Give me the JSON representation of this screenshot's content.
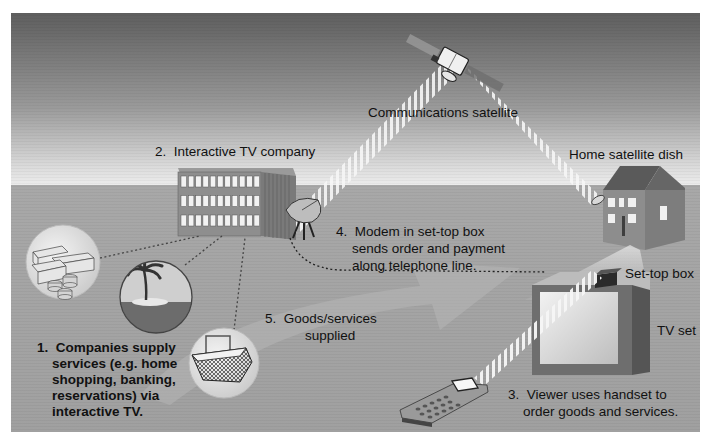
{
  "diagram": {
    "colors": {
      "sky_top": "#5e5e5e",
      "sky_horizon": "#e6e6e6",
      "ground": "#a3a3a3",
      "frame": "#ffffff",
      "beam": "#f4f4f4",
      "text": "#111111"
    },
    "labels": {
      "satellite": "Communications satellite",
      "company": "2.  Interactive TV company",
      "home_dish": "Home satellite dish",
      "set_top_box": "Set-top box",
      "tv_set": "TV set"
    },
    "steps": [
      {
        "number": "1.",
        "lines": [
          "Companies supply",
          "services (e.g. home",
          "shopping, banking,",
          "reservations) via",
          "interactive TV."
        ]
      },
      {
        "number": "2.",
        "lines": [
          "Interactive TV company"
        ]
      },
      {
        "number": "3.",
        "lines": [
          "Viewer uses handset to",
          "order goods and services."
        ]
      },
      {
        "number": "4.",
        "lines": [
          "Modem in set-top box",
          "sends order and payment",
          "along telephone line."
        ]
      },
      {
        "number": "5.",
        "lines": [
          "Goods/services",
          "supplied"
        ]
      }
    ],
    "icons": {
      "money": "money-stack-icon",
      "island": "palm-island-icon",
      "basket": "shopping-basket-icon",
      "satellite": "satellite-icon",
      "building": "office-building-icon",
      "company_dish": "satellite-dish-icon",
      "house": "house-icon",
      "tv": "television-icon",
      "handset": "remote-handset-icon"
    }
  }
}
